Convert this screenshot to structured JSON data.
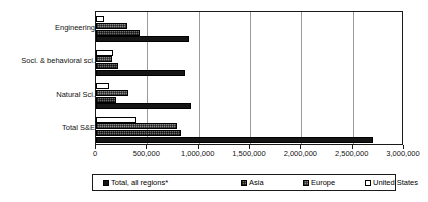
{
  "chart_data": {
    "type": "bar",
    "orientation": "horizontal",
    "title": "",
    "subtitle": "",
    "xlabel": "",
    "ylabel": "",
    "xlim": [
      0,
      3000000
    ],
    "grid": true,
    "legend_position": "bottom",
    "categories": [
      "Engineering",
      "Soci. & behavioral sci.",
      "Natural Sci.",
      "Total S&E"
    ],
    "tick_labels": [
      "0",
      "500,000",
      "1,000,000",
      "1,500,000",
      "2,000,000",
      "2,500,000",
      "3,000,000"
    ],
    "tick_values": [
      0,
      500000,
      1000000,
      1500000,
      2000000,
      2500000,
      3000000
    ],
    "series": [
      {
        "name": "Total, all regions*",
        "key": "total",
        "pattern": "solid-black",
        "color": "#151515",
        "values": [
          910000,
          870000,
          930000,
          2700000
        ]
      },
      {
        "name": "Asia",
        "key": "asia",
        "pattern": "dark-crosshatch",
        "color": "#6e6e6e",
        "values": [
          430000,
          210000,
          190000,
          830000
        ]
      },
      {
        "name": "Europe",
        "key": "europe",
        "pattern": "crosshatch",
        "color": "#8a8a8a",
        "values": [
          300000,
          160000,
          310000,
          790000
        ]
      },
      {
        "name": "United States",
        "key": "united_states",
        "pattern": "open-white",
        "color": "#ffffff",
        "values": [
          80000,
          170000,
          130000,
          390000
        ]
      }
    ]
  },
  "legend": {
    "items": [
      {
        "label": "Total, all regions*",
        "key": "total"
      },
      {
        "label": "Asia",
        "key": "asia"
      },
      {
        "label": "Europe",
        "key": "europe"
      },
      {
        "label": "United States",
        "key": "united_states"
      }
    ]
  }
}
